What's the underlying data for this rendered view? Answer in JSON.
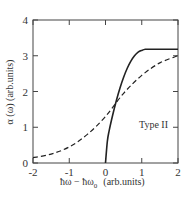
{
  "chart_data": {
    "type": "line",
    "title": "",
    "xlabel": "ħω − ħω₀  (arb.units)",
    "ylabel": "α (ω)  (arb.units)",
    "xlim": [
      -2,
      2
    ],
    "ylim": [
      0,
      4
    ],
    "xticks": [
      "-2",
      "-1",
      "0",
      "1",
      "2"
    ],
    "yticks": [
      "0",
      "1",
      "2",
      "3",
      "4"
    ],
    "grid": false,
    "legend": null,
    "annotations": [
      {
        "text": "Type II",
        "x": 1.1,
        "y": 1.2
      }
    ],
    "series": [
      {
        "name": "solid",
        "style": "solid",
        "x": [
          -2,
          -1,
          0,
          0.05,
          0.1,
          0.2,
          0.3,
          0.4,
          0.5,
          0.6,
          0.7,
          0.8,
          0.9,
          1.0,
          1.1,
          1.2,
          1.5,
          2.0
        ],
        "y": [
          0,
          0,
          0,
          0.6,
          0.9,
          1.35,
          1.75,
          2.1,
          2.4,
          2.65,
          2.85,
          3.0,
          3.1,
          3.15,
          3.18,
          3.18,
          3.18,
          3.18
        ]
      },
      {
        "name": "dashed",
        "style": "dashed",
        "x": [
          -2,
          -1.5,
          -1,
          -0.5,
          0,
          0.5,
          1,
          1.5,
          2
        ],
        "y": [
          0.15,
          0.25,
          0.45,
          0.8,
          1.3,
          1.95,
          2.45,
          2.8,
          3.0
        ]
      }
    ]
  },
  "labels": {
    "xlabel_main": "ħω − ħω",
    "xlabel_sub": "0",
    "xlabel_units": "(arb.units)",
    "ylabel": "α (ω)  (arb.units)",
    "annotation": "Type II",
    "xticks": [
      "-2",
      "-1",
      "0",
      "1",
      "2"
    ],
    "yticks": [
      "0",
      "1",
      "2",
      "3",
      "4"
    ]
  }
}
